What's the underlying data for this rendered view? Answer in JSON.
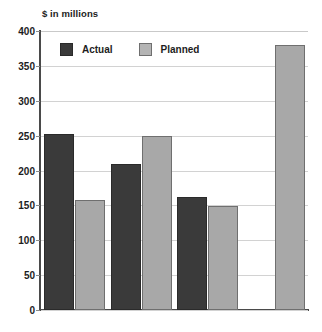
{
  "chart_data": {
    "type": "bar",
    "title": "",
    "clipped_title_fragment": "",
    "ylabel": "$ in millions",
    "xlabel": "",
    "ylim": [
      0,
      400
    ],
    "yticks": [
      0,
      50,
      100,
      150,
      200,
      250,
      300,
      350,
      400
    ],
    "ytick_labels": [
      "0",
      "50",
      "100",
      "150",
      "200",
      "250",
      "300",
      "350",
      "400"
    ],
    "grid": true,
    "legend_position": "top-left-inside",
    "categories": [
      "1985",
      "1990",
      "1995",
      "2000"
    ],
    "category_labels": [
      {
        "main": "1985",
        "suffix": ""
      },
      {
        "main": "1990",
        "suffix": ""
      },
      {
        "main": "1995",
        "suffix": ""
      },
      {
        "main": "2000",
        "suffix": "(projected)"
      }
    ],
    "series": [
      {
        "name": "Actual",
        "color": "#3a3a3a",
        "values": [
          252,
          210,
          162,
          null
        ]
      },
      {
        "name": "Planned",
        "color": "#a8a8a8",
        "values": [
          158,
          250,
          149,
          380
        ]
      }
    ]
  },
  "colors": {
    "actual": "#3a3a3a",
    "planned": "#a8a8a8",
    "axis": "#4a4a4a",
    "gridline": "#d2d2d2",
    "text": "#1d1d1d",
    "background": "#ffffff"
  }
}
